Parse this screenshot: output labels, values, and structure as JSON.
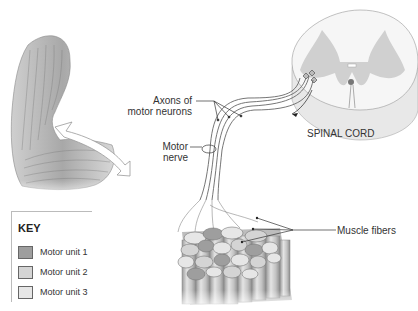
{
  "diagram": {
    "labels": {
      "axons": [
        "Axons of",
        "motor neurons"
      ],
      "motor_nerve": [
        "Motor",
        "nerve"
      ],
      "spinal_cord": "SPINAL CORD",
      "muscle_fibers": "Muscle fibers"
    },
    "key": {
      "title": "KEY",
      "items": [
        {
          "label": "Motor unit 1",
          "color": "#9e9e9e"
        },
        {
          "label": "Motor unit 2",
          "color": "#d4d4d4"
        },
        {
          "label": "Motor unit 3",
          "color": "#e6e6e6"
        }
      ]
    }
  }
}
